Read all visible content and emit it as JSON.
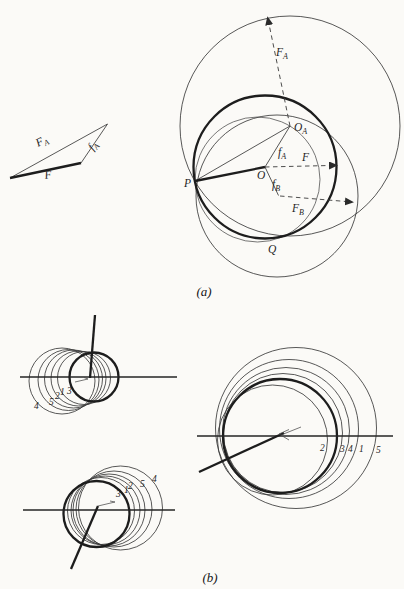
{
  "figure": {
    "caption_a": "(a)",
    "caption_b": "(b)",
    "colors": {
      "ink": "#2b2b2b",
      "paper": "#fbfaf7"
    },
    "part_a": {
      "force_triangle": {
        "label_FA": {
          "main": "F",
          "sub": "A"
        },
        "label_fA": {
          "main": "f",
          "sub": "A"
        },
        "label_F": "F"
      },
      "circle_diagram": {
        "label_P": "P",
        "label_O": "O",
        "label_OA": {
          "main": "O",
          "sub": "A"
        },
        "label_Q": "Q",
        "label_F": "F",
        "label_FA": {
          "main": "F",
          "sub": "A"
        },
        "label_FB": {
          "main": "F",
          "sub": "B"
        },
        "label_fA": {
          "main": "f",
          "sub": "A"
        },
        "label_fB": {
          "main": "f",
          "sub": "B"
        }
      }
    },
    "part_b": {
      "cluster_top_left_labels": [
        "4",
        "5",
        "2",
        "1",
        "3"
      ],
      "cluster_bottom_left_labels": [
        "3",
        "1",
        "2",
        "5",
        "4"
      ],
      "cluster_right_labels": [
        "2",
        "3",
        "4",
        "1",
        "5"
      ]
    }
  }
}
